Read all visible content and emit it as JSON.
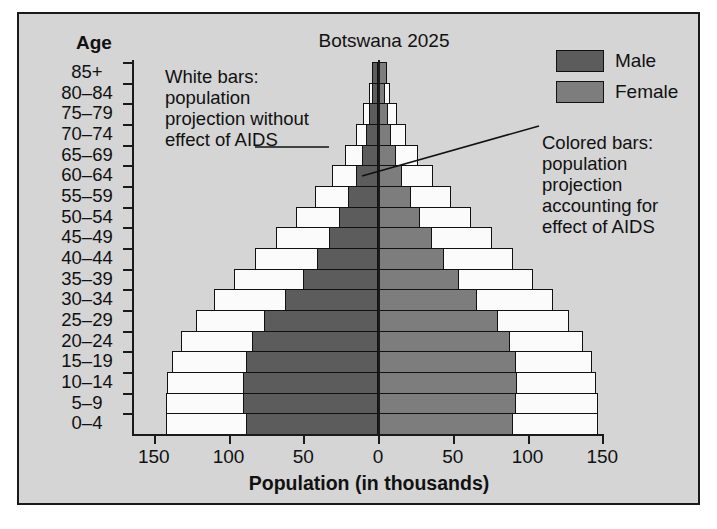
{
  "chart_data": {
    "type": "bar",
    "subtype": "population-pyramid",
    "title": "Botswana 2025",
    "xlabel": "Population (in thousands)",
    "ylabel": "Age",
    "xlim": [
      -150,
      150
    ],
    "xticks": [
      150,
      100,
      50,
      0,
      50,
      100,
      150
    ],
    "grid": false,
    "legend_position": "top-right",
    "categories": [
      "85+",
      "80–84",
      "75–79",
      "70–74",
      "65–69",
      "60–64",
      "55–59",
      "50–54",
      "45–49",
      "40–44",
      "35–39",
      "30–34",
      "25–29",
      "20–24",
      "15–19",
      "10–14",
      "5–9",
      "0–4"
    ],
    "series": [
      {
        "name": "Male",
        "side": "left",
        "kind": "colored",
        "values": [
          4,
          4,
          6,
          8,
          11,
          15,
          20,
          26,
          33,
          41,
          50,
          62,
          76,
          84,
          88,
          90,
          90,
          88
        ]
      },
      {
        "name": "Female",
        "side": "right",
        "kind": "colored",
        "values": [
          6,
          5,
          7,
          9,
          12,
          16,
          22,
          28,
          36,
          44,
          54,
          66,
          80,
          88,
          92,
          93,
          92,
          90
        ]
      },
      {
        "name": "Male without AIDS",
        "side": "left",
        "kind": "white",
        "values": [
          3,
          6,
          10,
          15,
          22,
          31,
          42,
          55,
          68,
          82,
          96,
          110,
          122,
          132,
          138,
          141,
          142,
          142
        ]
      },
      {
        "name": "Female without AIDS",
        "side": "right",
        "kind": "white",
        "values": [
          4,
          8,
          13,
          19,
          27,
          37,
          49,
          62,
          76,
          90,
          104,
          117,
          128,
          137,
          143,
          146,
          147,
          147
        ]
      }
    ],
    "annotations": [
      {
        "id": "white-bars-note",
        "text": "White bars: population projection without effect of AIDS"
      },
      {
        "id": "colored-bars-note",
        "text": "Colored bars: population projection accounting for effect of AIDS"
      }
    ]
  },
  "title": "Botswana 2025",
  "age_header": "Age",
  "age_labels": [
    "85+",
    "80–84",
    "75–79",
    "70–74",
    "65–69",
    "60–64",
    "55–59",
    "50–54",
    "45–49",
    "40–44",
    "35–39",
    "30–34",
    "25–29",
    "20–24",
    "15–19",
    "10–14",
    "5–9",
    "0–4"
  ],
  "x_tick_labels": [
    "150",
    "100",
    "50",
    "0",
    "50",
    "100",
    "150"
  ],
  "x_axis_title": "Population (in thousands)",
  "legend": {
    "items": [
      {
        "label": "Male",
        "color": "#5c5c5c",
        "swatch": "male"
      },
      {
        "label": "Female",
        "color": "#7d7d7d",
        "swatch": "female"
      }
    ]
  },
  "annotation_left": "White bars: population projection without effect of AIDS",
  "annotation_right": "Colored bars: population projection accounting for effect of AIDS",
  "colors": {
    "background": "#d5d5d5",
    "male": "#5c5c5c",
    "female": "#7d7d7d",
    "white_bar": "#fbfbfb",
    "axis": "#1a1a1a"
  }
}
